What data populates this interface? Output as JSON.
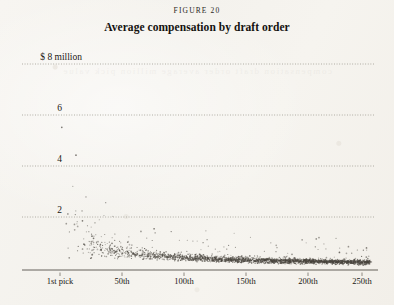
{
  "figure": {
    "label": "FIGURE 20",
    "title": "Average compensation by draft order"
  },
  "bleed_text": "compensation draft order average million pick value",
  "chart_data": {
    "type": "scatter",
    "title": "Average compensation by draft order",
    "subtitle": "FIGURE 20",
    "xlabel": "",
    "ylabel": "",
    "grid": true,
    "legend": false,
    "xlim": [
      0,
      262
    ],
    "ylim": [
      0,
      8.6
    ],
    "x_ticks": [
      1,
      50,
      100,
      150,
      200,
      250
    ],
    "x_tick_labels": [
      "1st pick",
      "50th",
      "100th",
      "150th",
      "200th",
      "250th"
    ],
    "y_ticks": [
      2,
      4,
      6,
      8
    ],
    "y_tick_labels": [
      "2",
      "4",
      "6",
      "$ 8 million"
    ],
    "y_unit": "millions of dollars",
    "point_color": "#4a463f",
    "point_count": 2100,
    "trend": {
      "model": "power_law",
      "formula": "y = 7.2 * pick^-0.62",
      "x": [
        1,
        2,
        3,
        5,
        8,
        10,
        15,
        20,
        25,
        30,
        40,
        50,
        60,
        75,
        100,
        125,
        150,
        175,
        200,
        225,
        250
      ],
      "y": [
        7.2,
        4.7,
        3.6,
        2.7,
        2.0,
        1.8,
        1.4,
        1.2,
        1.05,
        0.93,
        0.78,
        0.68,
        0.62,
        0.54,
        0.45,
        0.39,
        0.35,
        0.32,
        0.3,
        0.28,
        0.26
      ]
    },
    "spread": {
      "note": "Vertical dispersion is widest at the earliest picks (roughly 3 to 8 million at pick 1-5) and narrows to a band under 1 million after pick 60, with occasional outliers reaching 2 to 2.6 million."
    }
  },
  "axes": {
    "y_gridlines": [
      {
        "value": 8,
        "label": "$ 8 million",
        "y_px": 64
      },
      {
        "value": 6,
        "label": "6",
        "y_px": 115
      },
      {
        "value": 4,
        "label": "4",
        "y_px": 166
      },
      {
        "value": 2,
        "label": "2",
        "y_px": 217
      }
    ],
    "x_ticks": [
      {
        "value": 1,
        "label": "1st pick",
        "x_px": 60
      },
      {
        "value": 50,
        "label": "50th",
        "x_px": 122
      },
      {
        "value": 100,
        "label": "100th",
        "x_px": 184
      },
      {
        "value": 150,
        "label": "150th",
        "x_px": 246
      },
      {
        "value": 200,
        "label": "200th",
        "x_px": 308
      },
      {
        "value": 250,
        "label": "250th",
        "x_px": 362
      }
    ],
    "baseline_y_px": 270,
    "baseline_x_start_px": 22,
    "baseline_x_end_px": 378
  }
}
